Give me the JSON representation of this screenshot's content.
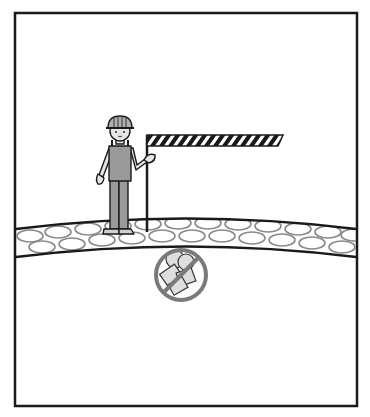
{
  "illustration": {
    "description": "Worker standing on road surface holding a striped barrier; prohibition sign over rubble below the road layer",
    "colors": {
      "frame": "#1a1a1a",
      "background": "#ffffff",
      "clothing": "#9a9a9a",
      "skin": "#e6e6e6",
      "helmet": "#b0b0b0",
      "gravel_outline": "#8a8a8a",
      "prohibition_ring": "#7a7a7a",
      "rubble_fill": "#dedede",
      "stripe_dark": "#1a1a1a",
      "stripe_light": "#ffffff"
    },
    "elements": [
      {
        "name": "frame",
        "label": "frame border"
      },
      {
        "name": "worker",
        "label": "construction worker with hard hat"
      },
      {
        "name": "barrier",
        "label": "striped barrier on pole"
      },
      {
        "name": "gravel-layer",
        "label": "gravel road layer"
      },
      {
        "name": "prohibition-sign",
        "label": "no rubble / prohibited sign"
      }
    ]
  }
}
